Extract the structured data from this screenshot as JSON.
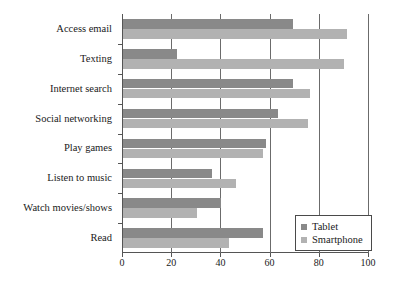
{
  "chart_data": {
    "type": "bar",
    "orientation": "horizontal",
    "title": "",
    "xlabel": "",
    "ylabel": "",
    "xlim": [
      0,
      100
    ],
    "xticks": [
      0,
      20,
      40,
      60,
      80,
      100
    ],
    "grid": true,
    "legend_position": "bottom-right",
    "categories": [
      "Access email",
      "Texting",
      "Internet search",
      "Social networking",
      "Play games",
      "Listen to music",
      "Watch movies/shows",
      "Read"
    ],
    "series": [
      {
        "name": "Tablet",
        "color": "#898989",
        "values": [
          69,
          22,
          69,
          63,
          58,
          36,
          40,
          57
        ]
      },
      {
        "name": "Smartphone",
        "color": "#b2b2b2",
        "values": [
          91,
          90,
          76,
          75,
          57,
          46,
          30,
          43
        ]
      }
    ]
  },
  "legend": {
    "items": [
      {
        "label": "Tablet",
        "swatch": "tablet"
      },
      {
        "label": "Smartphone",
        "swatch": "smartphone"
      }
    ]
  },
  "axis": {
    "tick_labels": [
      "0",
      "20",
      "40",
      "60",
      "80",
      "100"
    ]
  }
}
